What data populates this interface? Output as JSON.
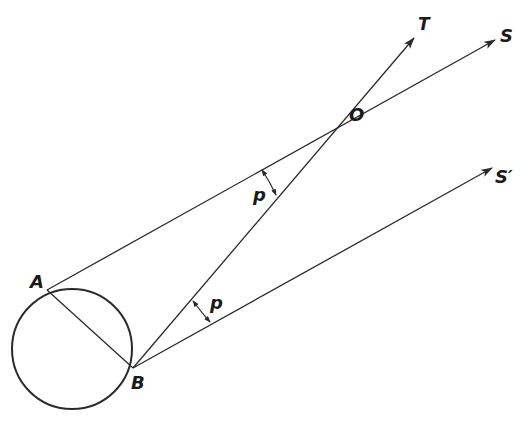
{
  "diagram": {
    "type": "geometry-parallax",
    "colors": {
      "stroke": "#2a2a2a",
      "text": "#1a1a1a",
      "background": "#ffffff"
    },
    "labels": {
      "T": "T",
      "S": "S",
      "S_prime": "S′",
      "O": "O",
      "A": "A",
      "B": "B",
      "p_upper": "p",
      "p_lower": "p"
    },
    "points": {
      "A": [
        47,
        290
      ],
      "B": [
        133,
        368
      ],
      "O": [
        370,
        123
      ],
      "T_tip": [
        414,
        38
      ],
      "S_tip": [
        495,
        40
      ],
      "S_prime_tip": [
        492,
        168
      ],
      "circle_center": [
        72,
        349
      ],
      "circle_radius": 60
    }
  }
}
